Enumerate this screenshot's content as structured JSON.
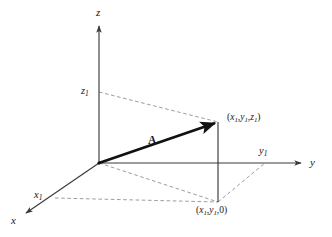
{
  "figure": {
    "background_color": "#ffffff",
    "line_color": "#3a3a3e",
    "vector_color": "#111114",
    "dashed_color": "#8a8a90",
    "text_color": "#16161a",
    "width": 332,
    "height": 237
  },
  "axes": [
    {
      "id": "z-axis",
      "label": "z",
      "direction": "up",
      "from": [
        99,
        163
      ],
      "to": [
        99,
        22
      ],
      "arrow": true
    },
    {
      "id": "y-axis",
      "label": "y",
      "direction": "right",
      "from": [
        99,
        163
      ],
      "to": [
        305,
        163
      ],
      "arrow": true
    },
    {
      "id": "x-axis",
      "label": "x",
      "direction": "down-left",
      "from": [
        99,
        163
      ],
      "to": [
        22,
        216
      ],
      "arrow": true
    }
  ],
  "axis_labels": {
    "z": "z",
    "y": "y",
    "x": "x"
  },
  "tick_labels": [
    {
      "id": "z1",
      "base": "z",
      "sub": "1",
      "axis": "z",
      "at": [
        99,
        92
      ]
    },
    {
      "id": "y1",
      "base": "y",
      "sub": "1",
      "axis": "y",
      "at": [
        265,
        163
      ]
    },
    {
      "id": "x1",
      "base": "x",
      "sub": "1",
      "axis": "x",
      "at": [
        67,
        192
      ]
    }
  ],
  "vector": {
    "name": "A",
    "label": "A",
    "from": [
      99,
      163
    ],
    "to": [
      218,
      122
    ],
    "style": "bold-solid-arrow"
  },
  "points": [
    {
      "id": "point-xyz",
      "coords_text": "(x1,y1,z1)",
      "parts": {
        "open": "(",
        "x": "x",
        "xs": "1",
        "c1": ",",
        "y": "y",
        "ys": "1",
        "c2": ",",
        "z": "z",
        "zs": "1",
        "close": ")"
      },
      "at": [
        218,
        122
      ],
      "label_at": [
        225,
        118
      ]
    },
    {
      "id": "point-xy0",
      "coords_text": "(x1,y1,0)",
      "parts": {
        "open": "(",
        "x": "x",
        "xs": "1",
        "c1": ",",
        "y": "y",
        "ys": "1",
        "c2": ",",
        "z": "0",
        "zs": "",
        "close": ")"
      },
      "at": [
        218,
        202
      ],
      "label_at": [
        196,
        206
      ]
    }
  ],
  "solid_lines": [
    {
      "id": "projection-vertical",
      "from": [
        218,
        122
      ],
      "to": [
        218,
        202
      ]
    }
  ],
  "dashed_lines": [
    {
      "id": "z1-to-point",
      "from": [
        99,
        92
      ],
      "to": [
        218,
        122
      ]
    },
    {
      "id": "origin-to-foot",
      "from": [
        99,
        163
      ],
      "to": [
        218,
        202
      ]
    },
    {
      "id": "x1-to-foot",
      "from": [
        55,
        198
      ],
      "to": [
        218,
        202
      ]
    },
    {
      "id": "foot-to-y1",
      "from": [
        218,
        202
      ],
      "to": [
        265,
        163
      ]
    }
  ]
}
